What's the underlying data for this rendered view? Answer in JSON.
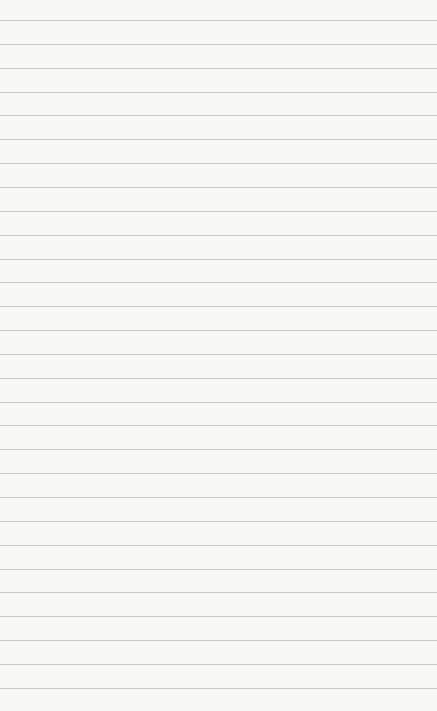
{
  "paper": {
    "type": "lined-paper",
    "background_color": "#f7f7f6",
    "line_color": "#c9c9c9",
    "first_line_y": 20,
    "line_spacing": 23.85,
    "line_count": 29
  }
}
